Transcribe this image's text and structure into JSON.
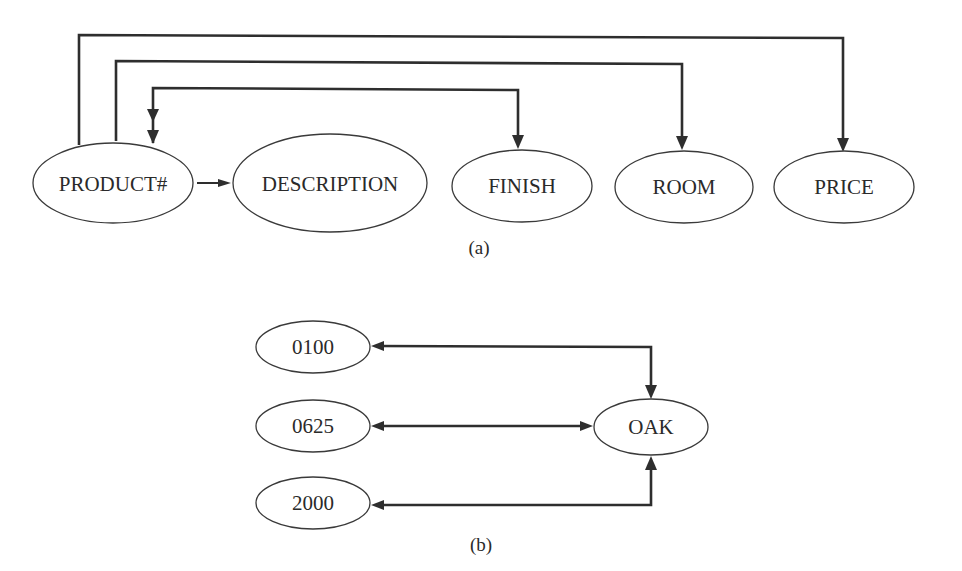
{
  "diagram_a": {
    "caption": "(a)",
    "nodes": [
      {
        "id": "product",
        "label": "PRODUCT#"
      },
      {
        "id": "description",
        "label": "DESCRIPTION"
      },
      {
        "id": "finish",
        "label": "FINISH"
      },
      {
        "id": "room",
        "label": "ROOM"
      },
      {
        "id": "price",
        "label": "PRICE"
      }
    ],
    "edges": [
      {
        "from": "PRODUCT#",
        "to": "DESCRIPTION"
      },
      {
        "from": "PRODUCT#",
        "to": "FINISH"
      },
      {
        "from": "FINISH",
        "to": "PRODUCT#"
      },
      {
        "from": "PRODUCT#",
        "to": "ROOM"
      },
      {
        "from": "PRODUCT#",
        "to": "PRICE"
      }
    ]
  },
  "diagram_b": {
    "caption": "(b)",
    "nodes": [
      {
        "id": "p0100",
        "label": "0100"
      },
      {
        "id": "p0625",
        "label": "0625"
      },
      {
        "id": "p2000",
        "label": "2000"
      },
      {
        "id": "oak",
        "label": "OAK"
      }
    ],
    "edges": [
      {
        "from": "0100",
        "to": "OAK",
        "bidirectional": true
      },
      {
        "from": "0625",
        "to": "OAK",
        "bidirectional": true
      },
      {
        "from": "2000",
        "to": "OAK",
        "bidirectional": true
      }
    ]
  }
}
